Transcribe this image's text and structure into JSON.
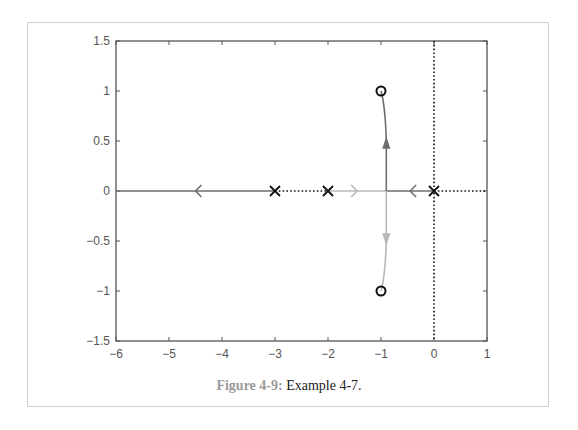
{
  "caption": {
    "figure_label": "Figure 4-9:",
    "text": " Example 4-7."
  },
  "chart_data": {
    "type": "line",
    "title": "",
    "subtitle": "Root locus plot",
    "xlabel": "",
    "ylabel": "",
    "xlim": [
      -6,
      1
    ],
    "ylim": [
      -1.5,
      1.5
    ],
    "grid": false,
    "x_ticks": [
      -6,
      -5,
      -4,
      -3,
      -2,
      -1,
      0,
      1
    ],
    "x_tick_labels": [
      "−6",
      "−5",
      "−4",
      "−3",
      "−2",
      "−1",
      "0",
      "1"
    ],
    "y_ticks": [
      1.5,
      1,
      0.5,
      0,
      -0.5,
      -1,
      -1.5
    ],
    "y_tick_labels": [
      "1.5",
      "1",
      "0.5",
      "0",
      "−0.5",
      "−1",
      "−1.5"
    ],
    "poles": [
      [
        0,
        0
      ],
      [
        -2,
        0
      ],
      [
        -3,
        0
      ]
    ],
    "zeros": [
      [
        -1,
        1
      ],
      [
        -1,
        -1
      ]
    ],
    "breakaway_point": [
      -0.9,
      0
    ],
    "series": [
      {
        "name": "branch from pole -3 to -infinity",
        "color": "#6e6e6e",
        "points": [
          [
            -3,
            0
          ],
          [
            -6,
            0
          ]
        ],
        "arrow_at": [
          -4.5,
          0
        ],
        "arrow_dir": "left"
      },
      {
        "name": "branch from pole 0 to breakaway then zero (-1, 1)",
        "color": "#6e6e6e",
        "points": [
          [
            0,
            0
          ],
          [
            -0.9,
            0
          ],
          [
            -0.9,
            0.5
          ],
          [
            -0.93,
            0.8
          ],
          [
            -1,
            1
          ]
        ],
        "arrow_at": [
          [
            -0.45,
            0
          ],
          [
            -0.9,
            0.5
          ]
        ],
        "arrow_dir": [
          "left",
          "up"
        ]
      },
      {
        "name": "branch from pole -2 to breakaway then zero (-1, -1)",
        "color": "#b8b8b8",
        "points": [
          [
            -2,
            0
          ],
          [
            -0.9,
            0
          ],
          [
            -0.9,
            -0.5
          ],
          [
            -0.93,
            -0.8
          ],
          [
            -1,
            -1
          ]
        ],
        "arrow_at": [
          [
            -1.45,
            0
          ],
          [
            -0.9,
            -0.5
          ]
        ],
        "arrow_dir": [
          "right",
          "down"
        ]
      },
      {
        "name": "non-locus real axis segments (dotted)",
        "color": "#111111",
        "segments": [
          [
            [
              -3,
              0
            ],
            [
              -2,
              0
            ]
          ],
          [
            [
              0,
              0
            ],
            [
              1,
              0
            ]
          ]
        ]
      },
      {
        "name": "imaginary axis (dotted)",
        "color": "#111111",
        "segments": [
          [
            [
              0,
              -1.5
            ],
            [
              0,
              1.5
            ]
          ]
        ]
      }
    ],
    "legend": null
  }
}
